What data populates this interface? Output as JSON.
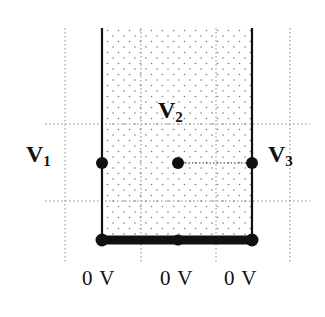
{
  "diagram": {
    "labels": {
      "v1": {
        "main": "V",
        "sub": "1"
      },
      "v2": {
        "main": "V",
        "sub": "2"
      },
      "v3": {
        "main": "V",
        "sub": "3"
      }
    },
    "ground_labels": [
      "0 V",
      "0 V",
      "0 V"
    ],
    "colors": {
      "line": "#111111",
      "grid": "#888888",
      "stipple": "#777777",
      "background": "#ffffff"
    }
  }
}
